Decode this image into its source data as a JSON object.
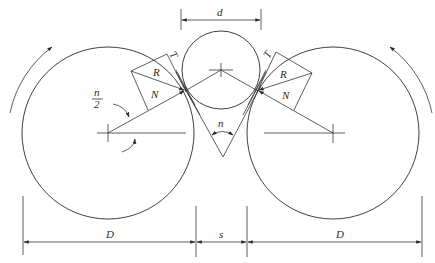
{
  "diagram": {
    "type": "roll-crusher-force-diagram",
    "stroke_color": "#2a2a2a",
    "background": "#ffffff",
    "labels": {
      "particle_diameter": "d",
      "roll_diameter_left": "D",
      "roll_diameter_right": "D",
      "gap": "s",
      "nip_angle": "n",
      "half_angle_numerator": "n",
      "half_angle_denominator": "2",
      "left_tangential": "T",
      "left_resultant": "R",
      "left_normal": "N",
      "right_tangential": "T",
      "right_resultant": "R",
      "right_normal": "N"
    },
    "elements": {
      "left_roll": {
        "center": [
          108,
          133
        ],
        "radius": 86,
        "rotation": "clockwise"
      },
      "right_roll": {
        "center": [
          333,
          133
        ],
        "radius": 86,
        "rotation": "counter-clockwise"
      },
      "particle": {
        "center": [
          221,
          70
        ],
        "radius": 39
      },
      "left_contact": [
        185,
        91
      ],
      "right_contact": [
        258,
        91
      ],
      "nip_apex": [
        223,
        157
      ]
    }
  }
}
